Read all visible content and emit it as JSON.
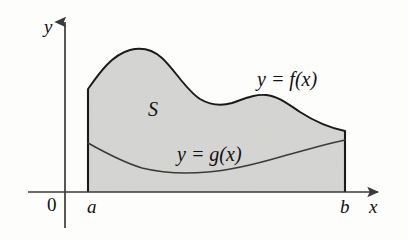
{
  "figure": {
    "kind": "area-between-curves-diagram",
    "width": 408,
    "height": 240,
    "background_color": "#fdfdfb",
    "stroke_color": "#1a1a1a",
    "axis_color": "#3a3a3a",
    "region_fill_color": "#d6d6d4"
  },
  "axes": {
    "y_label": "y",
    "x_label": "x",
    "origin_label": "0",
    "x_axis_y": 192,
    "y_axis_x": 65,
    "x_axis_start": 28,
    "x_axis_end": 382,
    "y_axis_top": 18,
    "y_axis_bottom": 228
  },
  "ticks": {
    "left_bound_label": "a",
    "right_bound_label": "b",
    "left_bound_x": 88,
    "right_bound_x": 345
  },
  "region": {
    "label": "S",
    "label_x": 153,
    "label_y": 110
  },
  "curves": [
    {
      "name": "upper-curve",
      "label": "y = f(x)",
      "label_x": 258,
      "label_y": 70,
      "path": "M 88 89 C 100 72, 112 55, 130 50 C 142 47, 152 49, 162 58 C 175 70, 186 90, 200 99 C 212 106, 222 106, 232 103 C 244 99, 254 94, 266 95 C 278 96, 288 104, 300 112 C 314 121, 330 128, 345 131",
      "points": [
        {
          "x": 88,
          "y": 89
        },
        {
          "x": 130,
          "y": 50
        },
        {
          "x": 148,
          "y": 50
        },
        {
          "x": 200,
          "y": 99
        },
        {
          "x": 230,
          "y": 104
        },
        {
          "x": 268,
          "y": 95
        },
        {
          "x": 300,
          "y": 112
        },
        {
          "x": 345,
          "y": 131
        }
      ]
    },
    {
      "name": "lower-curve",
      "label": "y = g(x)",
      "label_x": 178,
      "label_y": 145,
      "path": "M 88 143 C 104 152, 122 162, 142 168 C 162 173, 186 174, 208 172 C 232 170, 256 164, 280 157 C 302 151, 326 144, 345 140",
      "points": [
        {
          "x": 88,
          "y": 143
        },
        {
          "x": 142,
          "y": 168
        },
        {
          "x": 208,
          "y": 172
        },
        {
          "x": 280,
          "y": 157
        },
        {
          "x": 345,
          "y": 140
        }
      ]
    }
  ],
  "shaded_area": {
    "description": "Region S between y = f(x) above and y = g(x) below, from x = a to x = b",
    "path": "M 88 89 C 100 72, 112 55, 130 50 C 142 47, 152 49, 162 58 C 175 70, 186 90, 200 99 C 212 106, 222 106, 232 103 C 244 99, 254 94, 266 95 C 278 96, 288 104, 300 112 C 314 121, 330 128, 345 131 L 345 192 L 88 192 Z"
  },
  "boundaries": {
    "left_edge": {
      "x": 88,
      "y_top": 89,
      "y_bottom": 192
    },
    "right_edge": {
      "x": 345,
      "y_top": 131,
      "y_bottom": 192
    }
  }
}
